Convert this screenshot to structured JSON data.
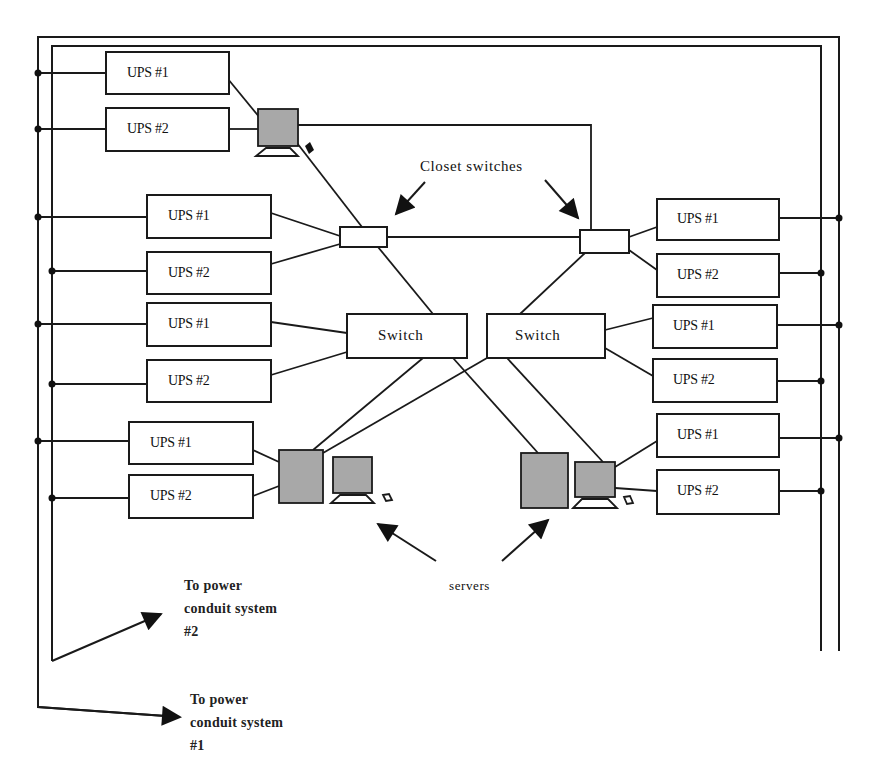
{
  "diagram": {
    "type": "network-power-topology",
    "colors": {
      "line": "#1a1a1a",
      "device_fill": "#a8a8a8",
      "background": "#ffffff"
    },
    "labels": {
      "closet_switches": "Closet switches",
      "servers": "servers",
      "conduit2": [
        "To power",
        "conduit system",
        "#2"
      ],
      "conduit1": [
        "To power",
        "conduit system",
        "#1"
      ]
    },
    "switches": [
      {
        "id": "switch-left",
        "label": "Switch"
      },
      {
        "id": "switch-right",
        "label": "Switch"
      }
    ],
    "closet_switches": [
      {
        "id": "closet-switch-left",
        "label": ""
      },
      {
        "id": "closet-switch-right",
        "label": ""
      }
    ],
    "ups_left": [
      {
        "label": "UPS #1",
        "bus": "outer"
      },
      {
        "label": "UPS #2",
        "bus": "outer"
      },
      {
        "label": "UPS #1",
        "bus": "outer"
      },
      {
        "label": "UPS #2",
        "bus": "inner"
      },
      {
        "label": "UPS #1",
        "bus": "outer"
      },
      {
        "label": "UPS #2",
        "bus": "inner"
      },
      {
        "label": "UPS #1",
        "bus": "outer"
      },
      {
        "label": "UPS #2",
        "bus": "inner"
      }
    ],
    "ups_right": [
      {
        "label": "UPS #1",
        "bus": "outer"
      },
      {
        "label": "UPS #2",
        "bus": "inner"
      },
      {
        "label": "UPS #1",
        "bus": "outer"
      },
      {
        "label": "UPS #2",
        "bus": "inner"
      },
      {
        "label": "UPS #1",
        "bus": "outer"
      },
      {
        "label": "UPS #2",
        "bus": "inner"
      }
    ],
    "devices": [
      {
        "id": "workstation-top",
        "kind": "monitor"
      },
      {
        "id": "server-left-tower",
        "kind": "tower"
      },
      {
        "id": "server-left-monitor",
        "kind": "monitor"
      },
      {
        "id": "server-right-tower",
        "kind": "tower"
      },
      {
        "id": "server-right-monitor",
        "kind": "monitor"
      }
    ]
  }
}
